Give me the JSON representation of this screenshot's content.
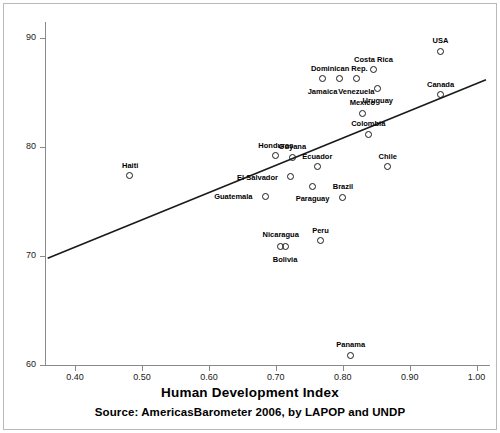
{
  "chart_data": {
    "type": "scatter",
    "title": "",
    "xlabel": "Human Development Index",
    "ylabel": "",
    "source_note": "Source: AmericasBarometer 2006, by LAPOP and UNDP",
    "xlim": [
      0.355,
      1.02
    ],
    "ylim": [
      60,
      91.5
    ],
    "grid": false,
    "legend": "none",
    "xticks": [
      "0.40",
      "0.50",
      "0.60",
      "0.70",
      "0.80",
      "0.90",
      "1.00"
    ],
    "xtick_values": [
      0.4,
      0.5,
      0.6,
      0.7,
      0.8,
      0.9,
      1.0
    ],
    "yticks": [
      "60",
      "70",
      "80",
      "90"
    ],
    "ytick_values": [
      60,
      70,
      80,
      90
    ],
    "marker_style": "open-circle",
    "points": [
      {
        "label": "Haiti",
        "x": 0.482,
        "y": 77.4,
        "lx": 0,
        "ly": -11
      },
      {
        "label": "Guatemala",
        "x": 0.684,
        "y": 75.5,
        "lx": -32,
        "ly": 0
      },
      {
        "label": "Honduras",
        "x": 0.7,
        "y": 79.2,
        "lx": 0,
        "ly": -11
      },
      {
        "label": "El Salvador",
        "x": 0.722,
        "y": 77.3,
        "lx": -33,
        "ly": 0
      },
      {
        "label": "Guyana",
        "x": 0.725,
        "y": 79.1,
        "lx": 0,
        "ly": -11
      },
      {
        "label": "Nicaragua",
        "x": 0.707,
        "y": 70.9,
        "lx": 0,
        "ly": -12
      },
      {
        "label": "Bolivia",
        "x": 0.714,
        "y": 70.9,
        "lx": 0,
        "ly": 13
      },
      {
        "label": "Paraguay",
        "x": 0.755,
        "y": 76.4,
        "lx": 0,
        "ly": 12
      },
      {
        "label": "Ecuador",
        "x": 0.762,
        "y": 78.2,
        "lx": 0,
        "ly": -11
      },
      {
        "label": "Jamaica",
        "x": 0.77,
        "y": 86.3,
        "lx": 0,
        "ly": 12
      },
      {
        "label": "Dominican Rep.",
        "x": 0.795,
        "y": 86.3,
        "lx": 0,
        "ly": -11
      },
      {
        "label": "Venezuela",
        "x": 0.82,
        "y": 86.3,
        "lx": 0,
        "ly": 12
      },
      {
        "label": "Colombia",
        "x": 0.838,
        "y": 81.2,
        "lx": 0,
        "ly": -11
      },
      {
        "label": "Peru",
        "x": 0.767,
        "y": 71.4,
        "lx": 0,
        "ly": -11
      },
      {
        "label": "Brazil",
        "x": 0.8,
        "y": 75.4,
        "lx": 0,
        "ly": -11
      },
      {
        "label": "Mexico",
        "x": 0.829,
        "y": 83.1,
        "lx": 0,
        "ly": -11
      },
      {
        "label": "Costa Rica",
        "x": 0.846,
        "y": 87.1,
        "lx": 0,
        "ly": -11
      },
      {
        "label": "Uruguay",
        "x": 0.852,
        "y": 85.4,
        "lx": 0,
        "ly": 12
      },
      {
        "label": "Chile",
        "x": 0.867,
        "y": 78.2,
        "lx": 0,
        "ly": -11
      },
      {
        "label": "Panama",
        "x": 0.812,
        "y": 60.9,
        "lx": 0,
        "ly": -11
      },
      {
        "label": "Canada",
        "x": 0.946,
        "y": 84.8,
        "lx": 0,
        "ly": -11
      },
      {
        "label": "USA",
        "x": 0.946,
        "y": 88.8,
        "lx": 0,
        "ly": -11
      }
    ],
    "fit_line": {
      "x_start": 0.359,
      "y_start": 69.8,
      "x_end": 1.014,
      "y_end": 86.2
    }
  }
}
